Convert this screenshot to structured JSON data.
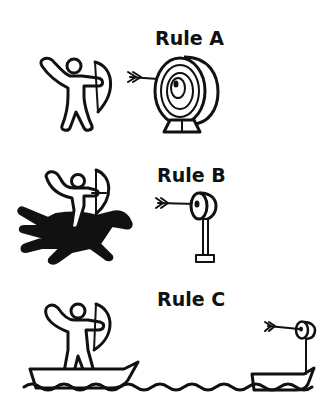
{
  "panels": [
    {
      "label": "Rule A",
      "scene": "archer standing on ground shooting at a large round target on a stand",
      "arrow_hits": "center"
    },
    {
      "label": "Rule B",
      "scene": "archer on a galloping horse shooting at a small target on a pole",
      "arrow_hits": "center"
    },
    {
      "label": "Rule C",
      "scene": "archer standing in a boat on water shooting at a small target on another boat",
      "arrow_hits": "center"
    }
  ],
  "colors": {
    "ink": "#111111",
    "background": "#ffffff"
  }
}
